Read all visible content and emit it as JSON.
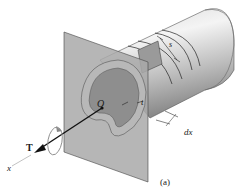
{
  "figure": {
    "caption": "(a)",
    "labels": {
      "origin": "O",
      "thickness": "t",
      "torque": "T",
      "axis": "x",
      "element_length": "dx",
      "arc_length": "s"
    },
    "colors": {
      "tube_light": "#e8e8e8",
      "tube_mid": "#b5b5b5",
      "tube_dark": "#7a7a7a",
      "plane": "#a8a8a8",
      "section_inner": "#8c8c8c",
      "wall": "#a0a0a0",
      "line": "#1a1a1a"
    }
  }
}
